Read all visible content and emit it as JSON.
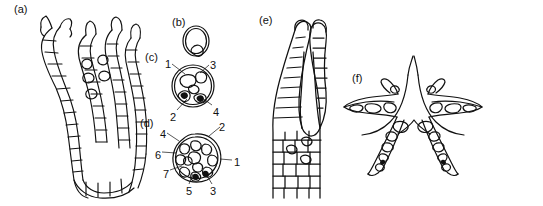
{
  "figure": {
    "kind": "scientific-line-drawing",
    "background_color": "#ffffff",
    "ink_color": "#111111",
    "panel_count": 6
  },
  "panels": [
    {
      "id": "a",
      "caption": "(a)",
      "caption_x": 14,
      "caption_y": 4,
      "description": "longitudinal-section-of-branched-filamentous-thallus"
    },
    {
      "id": "b",
      "caption": "(b)",
      "caption_x": 172,
      "caption_y": 17,
      "description": "small-oval-cell-with-single-inclusion"
    },
    {
      "id": "c",
      "caption": "(c)",
      "caption_x": 145,
      "caption_y": 52,
      "description": "transverse-section-with-four-labelled-regions"
    },
    {
      "id": "d",
      "caption": "(d)",
      "caption_x": 140,
      "caption_y": 118,
      "description": "transverse-section-with-seven-labelled-regions"
    },
    {
      "id": "e",
      "caption": "(e)",
      "caption_x": 259,
      "caption_y": 15,
      "description": "forked-y-shaped-apex-longitudinal-section"
    },
    {
      "id": "f",
      "caption": "(f)",
      "caption_x": 352,
      "caption_y": 73,
      "description": "symmetric-winged-arch-transverse-section"
    }
  ],
  "labels_c": [
    {
      "text": "1",
      "x": 165,
      "y": 59,
      "leader": [
        172,
        66,
        185,
        75
      ]
    },
    {
      "text": "2",
      "x": 170,
      "y": 112,
      "leader": [
        177,
        113,
        188,
        101
      ]
    },
    {
      "text": "3",
      "x": 210,
      "y": 60,
      "leader": [
        209,
        67,
        200,
        74
      ]
    },
    {
      "text": "4",
      "x": 213,
      "y": 107,
      "leader": [
        213,
        108,
        202,
        100
      ]
    }
  ],
  "labels_d": [
    {
      "text": "1",
      "x": 234,
      "y": 157,
      "leader": [
        233,
        162,
        221,
        160
      ]
    },
    {
      "text": "2",
      "x": 219,
      "y": 122,
      "leader": [
        219,
        128,
        209,
        135
      ]
    },
    {
      "text": "3",
      "x": 210,
      "y": 186,
      "leader": [
        212,
        186,
        206,
        175
      ]
    },
    {
      "text": "4",
      "x": 160,
      "y": 129,
      "leader": [
        167,
        134,
        178,
        140
      ]
    },
    {
      "text": "5",
      "x": 186,
      "y": 186,
      "leader": [
        188,
        186,
        192,
        175
      ]
    },
    {
      "text": "6",
      "x": 155,
      "y": 150,
      "leader": [
        162,
        154,
        175,
        154
      ]
    },
    {
      "text": "7",
      "x": 163,
      "y": 169,
      "leader": [
        170,
        172,
        181,
        167
      ]
    }
  ]
}
